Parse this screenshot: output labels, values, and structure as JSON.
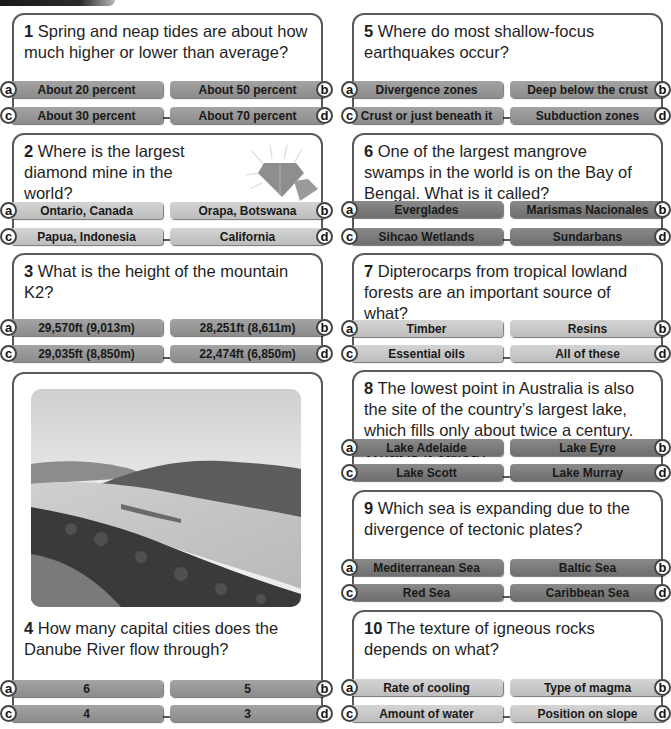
{
  "colors": {
    "border": "#5a5a5a",
    "bar_dark": "#7a7a7a",
    "bar_mid": "#969696",
    "bar_light": "#c8c8c8"
  },
  "questions": [
    {
      "number": "1",
      "text": "Spring and neap tides are about how much higher or lower than average?",
      "answers": {
        "a": "About 20 percent",
        "b": "About 50 percent",
        "c": "About 30 percent",
        "d": "About 70 percent"
      }
    },
    {
      "number": "2",
      "text": "Where is the largest diamond mine in the world?",
      "icon": "diamond-icon",
      "answers": {
        "a": "Ontario, Canada",
        "b": "Orapa, Botswana",
        "c": "Papua, Indonesia",
        "d": "California"
      }
    },
    {
      "number": "3",
      "text": "What is the height of the mountain K2?",
      "answers": {
        "a": "29,570ft (9,013m)",
        "b": "28,251ft (8,611m)",
        "c": "29,035ft (8,850m)",
        "d": "22,474ft (6,850m)"
      }
    },
    {
      "number": "4",
      "text": "How many capital cities does the Danube River flow through?",
      "image": "river-valley-photo",
      "answers": {
        "a": "6",
        "b": "5",
        "c": "4",
        "d": "3"
      }
    },
    {
      "number": "5",
      "text": "Where do most shallow-focus earthquakes occur?",
      "answers": {
        "a": "Divergence zones",
        "b": "Deep below the crust",
        "c": "Crust or just beneath it",
        "d": "Subduction zones"
      }
    },
    {
      "number": "6",
      "text": "One of the largest mangrove swamps in the world is on the Bay of Bengal. What is it called?",
      "answers": {
        "a": "Everglades",
        "b": "Marismas Nacionales",
        "c": "Sihcao Wetlands",
        "d": "Sundarbans"
      }
    },
    {
      "number": "7",
      "text": "Dipterocarps from tropical lowland forests are an important source of what?",
      "answers": {
        "a": "Timber",
        "b": "Resins",
        "c": "Essential oils",
        "d": "All of these"
      }
    },
    {
      "number": "8",
      "text": "The lowest point in Australia is also the site of the country’s largest lake, which fills only about twice a century. What is it called?",
      "answers": {
        "a": "Lake Adelaide",
        "b": "Lake Eyre",
        "c": "Lake Scott",
        "d": "Lake Murray"
      }
    },
    {
      "number": "9",
      "text": "Which sea is expanding due to the divergence of tectonic plates?",
      "answers": {
        "a": "Mediterranean Sea",
        "b": "Baltic Sea",
        "c": "Red Sea",
        "d": "Caribbean Sea"
      }
    },
    {
      "number": "10",
      "text": "The texture of igneous rocks depends on what?",
      "answers": {
        "a": "Rate of cooling",
        "b": "Type of magma",
        "c": "Amount of water",
        "d": "Position on slope"
      }
    }
  ],
  "letters": {
    "a": "a",
    "b": "b",
    "c": "c",
    "d": "d"
  }
}
